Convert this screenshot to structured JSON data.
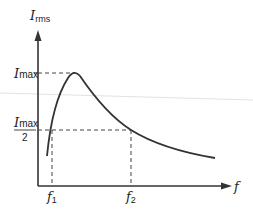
{
  "diagram": {
    "type": "resonance-curve",
    "y_axis": {
      "symbol": "I",
      "subscript": "rms"
    },
    "x_axis": {
      "symbol": "f"
    },
    "levels": {
      "max": {
        "symbol": "I",
        "subscript": "max"
      },
      "half": {
        "numerator_symbol": "I",
        "numerator_subscript": "max",
        "denominator": "2"
      }
    },
    "frequencies": [
      {
        "symbol": "f",
        "subscript": "1"
      },
      {
        "symbol": "f",
        "subscript": "2"
      }
    ],
    "colors": {
      "line": "#333333",
      "dash": "#444444",
      "stray_line": "#dddddd"
    }
  }
}
